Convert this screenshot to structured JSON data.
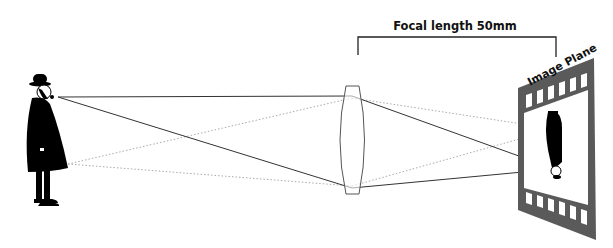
{
  "diagram": {
    "focal_length_label": "Focal length 50mm",
    "image_plane_label": "Image Plane",
    "lens": "convex-lens-icon",
    "film": "film-strip-icon",
    "colors": {
      "solid_ray": "#333333",
      "dotted_ray": "#aaaaaa",
      "film": "#5a5a5a",
      "silhouette": "#000000",
      "lens_outline": "#555555"
    }
  }
}
